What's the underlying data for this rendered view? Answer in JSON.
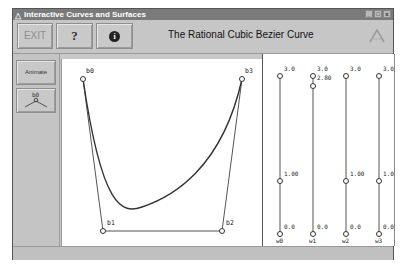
{
  "window": {
    "title": "Interactive Curves and Surfaces",
    "controls": [
      "minimize",
      "maximize",
      "close"
    ],
    "control_glyphs": [
      "_",
      "□",
      "x"
    ]
  },
  "toolbar": {
    "exit_label": "EXIT",
    "help_label": "?",
    "info_label": "i",
    "title": "The Rational Cubic Bezier Curve",
    "logo_icon": "triangle-logo-icon"
  },
  "left_panel": {
    "animate_label": "Animate",
    "point_button_label": "b0"
  },
  "canvas": {
    "control_points": [
      {
        "label": "b0",
        "x": 21,
        "y": 20
      },
      {
        "label": "b1",
        "x": 41,
        "y": 172
      },
      {
        "label": "b2",
        "x": 160,
        "y": 172
      },
      {
        "label": "b3",
        "x": 180,
        "y": 20
      }
    ],
    "colors": {
      "curve": "#444444",
      "polygon": "#555555",
      "point": "#333333"
    }
  },
  "weights": {
    "sliders": [
      {
        "label": "w0",
        "max": "3.0",
        "mid": "1.00",
        "min": "0.0",
        "value": 1.0
      },
      {
        "label": "w1",
        "max": "3.0",
        "mid": "2.80",
        "min": "0.0",
        "value": 2.8
      },
      {
        "label": "w2",
        "max": "3.0",
        "mid": "1.00",
        "min": "0.0",
        "value": 1.0
      },
      {
        "label": "w3",
        "max": "3.0",
        "mid": "1.00",
        "min": "0.0",
        "value": 1.0
      }
    ]
  },
  "status": {
    "text": ""
  }
}
